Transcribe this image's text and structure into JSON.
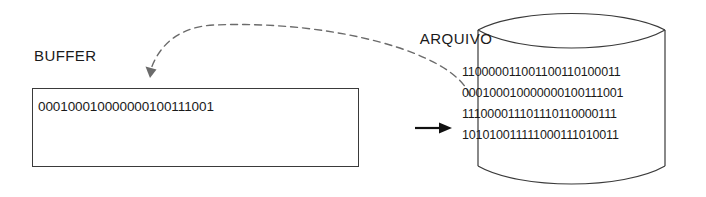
{
  "diagram": {
    "title_buffer": "BUFFER",
    "title_file": "ARQUIVO",
    "buffer": {
      "bits": "000100010000000100111001",
      "pointer_icon": "up-arrow-icon"
    },
    "file": {
      "rows": [
        "110000011001100110100011",
        "000100010000000100111001",
        "111000011101110110000111",
        "101010011111000111010011"
      ]
    },
    "connectors": {
      "read_arrow_icon": "dashed-curved-arrow-icon",
      "write_arrow_icon": "right-arrow-icon"
    },
    "colors": {
      "stroke": "#3a3a3a",
      "text": "#1a1a1a",
      "background": "#ffffff"
    }
  }
}
